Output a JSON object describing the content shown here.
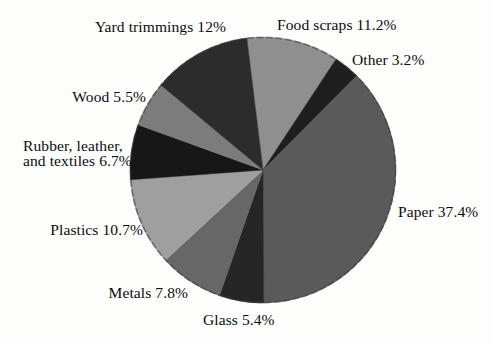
{
  "figure": {
    "background": "#fdfdfc",
    "text_color": "#0c0c0c"
  },
  "chart_data": {
    "type": "pie",
    "title": "",
    "unit": "%",
    "start_angle_deg": -7,
    "direction": "clockwise",
    "legend_position": "labels-around-pie",
    "rim_color": "#3a3a3a",
    "slices": [
      {
        "name": "Food scraps",
        "value": 11.2,
        "label": "Food scraps 11.2%",
        "color": "#8f8f8f"
      },
      {
        "name": "Other",
        "value": 3.2,
        "label": "Other 3.2%",
        "color": "#1e1e1e"
      },
      {
        "name": "Paper",
        "value": 37.4,
        "label": "Paper 37.4%",
        "color": "#5a5a5a"
      },
      {
        "name": "Glass",
        "value": 5.4,
        "label": "Glass 5.4%",
        "color": "#262626"
      },
      {
        "name": "Metals",
        "value": 7.8,
        "label": "Metals 7.8%",
        "color": "#676767"
      },
      {
        "name": "Plastics",
        "value": 10.7,
        "label": "Plastics 10.7%",
        "color": "#9f9f9f"
      },
      {
        "name": "Rubber, leather, and textiles",
        "value": 6.7,
        "label": "Rubber, leather,\nand textiles 6.7%",
        "color": "#171717"
      },
      {
        "name": "Wood",
        "value": 5.5,
        "label": "Wood 5.5%",
        "color": "#7c7c7c"
      },
      {
        "name": "Yard trimmings",
        "value": 12,
        "label": "Yard trimmings 12%",
        "color": "#2c2c2c"
      }
    ]
  }
}
